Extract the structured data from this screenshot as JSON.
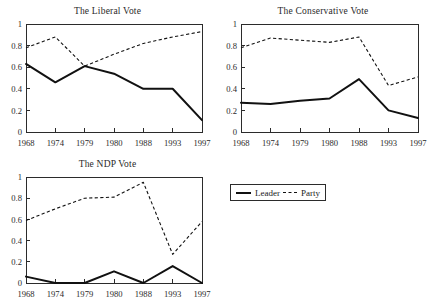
{
  "figure": {
    "legend": {
      "entries": [
        {
          "label": "Leader",
          "style": "solid"
        },
        {
          "label": "Party",
          "style": "dashed"
        }
      ]
    }
  },
  "chart_data": [
    {
      "type": "line",
      "title": "The Liberal Vote",
      "xlabel": "",
      "ylabel": "",
      "categories": [
        "1968",
        "1974",
        "1979",
        "1980",
        "1988",
        "1993",
        "1997"
      ],
      "x": [
        1968,
        1974,
        1979,
        1980,
        1988,
        1993,
        1997
      ],
      "ylim": [
        0,
        1
      ],
      "yticks": [
        0,
        0.2,
        0.4,
        0.6,
        0.8,
        1
      ],
      "ytick_labels": [
        "0",
        "0.2",
        "0.4",
        "0.6",
        "0.8",
        "1"
      ],
      "grid": false,
      "legend_position": "external-right",
      "series": [
        {
          "name": "Leader",
          "style": "solid",
          "values": [
            0.63,
            0.46,
            0.61,
            0.54,
            0.4,
            0.4,
            0.11
          ]
        },
        {
          "name": "Party",
          "style": "dashed",
          "values": [
            0.78,
            0.88,
            0.61,
            0.72,
            0.82,
            0.88,
            0.93
          ]
        }
      ]
    },
    {
      "type": "line",
      "title": "The Conservative Vote",
      "xlabel": "",
      "ylabel": "",
      "categories": [
        "1968",
        "1974",
        "1979",
        "1980",
        "1988",
        "1993",
        "1997"
      ],
      "x": [
        1968,
        1974,
        1979,
        1980,
        1988,
        1993,
        1997
      ],
      "ylim": [
        0,
        1
      ],
      "yticks": [
        0,
        0.2,
        0.4,
        0.6,
        0.8,
        1
      ],
      "ytick_labels": [
        "0",
        "0.2",
        "0.4",
        "0.6",
        "0.8",
        "1"
      ],
      "grid": false,
      "legend_position": "external-right",
      "series": [
        {
          "name": "Leader",
          "style": "solid",
          "values": [
            0.27,
            0.26,
            0.29,
            0.31,
            0.49,
            0.2,
            0.13
          ]
        },
        {
          "name": "Party",
          "style": "dashed",
          "values": [
            0.78,
            0.87,
            0.85,
            0.83,
            0.88,
            0.43,
            0.51
          ]
        }
      ]
    },
    {
      "type": "line",
      "title": "The NDP Vote",
      "xlabel": "",
      "ylabel": "",
      "categories": [
        "1968",
        "1974",
        "1979",
        "1980",
        "1988",
        "1993",
        "1997"
      ],
      "x": [
        1968,
        1974,
        1979,
        1980,
        1988,
        1993,
        1997
      ],
      "ylim": [
        0,
        1
      ],
      "yticks": [
        0,
        0.2,
        0.4,
        0.6,
        0.8,
        1
      ],
      "ytick_labels": [
        "0",
        "0.2",
        "0.4",
        "0.6",
        "0.8",
        "1"
      ],
      "grid": false,
      "legend_position": "external-right",
      "series": [
        {
          "name": "Leader",
          "style": "solid",
          "values": [
            0.06,
            0.0,
            0.0,
            0.11,
            0.0,
            0.16,
            0.0
          ]
        },
        {
          "name": "Party",
          "style": "dashed",
          "values": [
            0.59,
            0.7,
            0.8,
            0.81,
            0.95,
            0.27,
            0.58
          ]
        }
      ]
    }
  ]
}
